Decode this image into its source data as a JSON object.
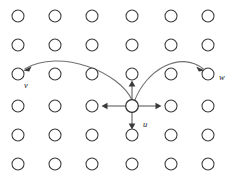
{
  "figure": {
    "background_color": "#ffffff",
    "node_stroke_color": "#3a3a3a",
    "node_fill_color": "#ffffff",
    "edge_color": "#707070",
    "arrow_color": "#3a3a3a",
    "label_color": "#1a1a1a",
    "grid": {
      "columns": 6,
      "rows": 6,
      "column_x": [
        18,
        55,
        92,
        132,
        171,
        208
      ],
      "row_y": [
        16,
        45,
        74,
        106,
        135,
        164
      ],
      "node_radius": 6
    },
    "center_node": {
      "col": 4,
      "row": 4,
      "x": 132,
      "y": 106
    },
    "labels": [
      {
        "id": "label-v",
        "text": "v",
        "x": 24,
        "y": 88
      },
      {
        "id": "label-u",
        "text": "u",
        "x": 143,
        "y": 127
      },
      {
        "id": "label-w",
        "text": "w",
        "x": 219,
        "y": 80
      }
    ],
    "straight_arrows": [
      {
        "id": "arrow-up",
        "direction": "up",
        "from": [
          132,
          106
        ],
        "to": [
          132,
          74
        ]
      },
      {
        "id": "arrow-down",
        "direction": "down",
        "from": [
          132,
          106
        ],
        "to": [
          132,
          135
        ]
      },
      {
        "id": "arrow-left",
        "direction": "left",
        "from": [
          132,
          106
        ],
        "to": [
          92,
          106
        ]
      },
      {
        "id": "arrow-right",
        "direction": "right",
        "from": [
          132,
          106
        ],
        "to": [
          171,
          106
        ]
      }
    ],
    "curved_arrows": [
      {
        "id": "curve-to-v",
        "from": [
          132,
          106
        ],
        "to": [
          18,
          74
        ],
        "target_label": "v"
      },
      {
        "id": "curve-to-w",
        "from": [
          132,
          106
        ],
        "to": [
          208,
          74
        ],
        "target_label": "w"
      }
    ]
  }
}
